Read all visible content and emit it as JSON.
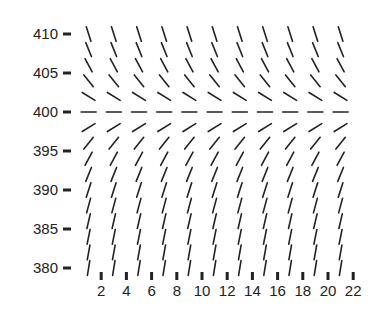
{
  "chart_data": {
    "type": "slope-field",
    "title": "",
    "xlabel": "",
    "ylabel": "",
    "xlim": [
      0,
      22
    ],
    "ylim": [
      380,
      410
    ],
    "x_ticks": [
      2,
      4,
      6,
      8,
      10,
      12,
      14,
      16,
      18,
      20,
      22
    ],
    "y_ticks": [
      380,
      385,
      390,
      395,
      400,
      405,
      410
    ],
    "grid": false,
    "legend": null,
    "field": {
      "equation": "dy/dx = k * (400 - y)",
      "k": 0.5,
      "equilibrium_y": 400,
      "x_samples": [
        1,
        3,
        5,
        7,
        9,
        11,
        13,
        15,
        17,
        19,
        21
      ],
      "y_samples": [
        380,
        382,
        384,
        386,
        388,
        390,
        392,
        394,
        396,
        398,
        400,
        402,
        404,
        406,
        408,
        410
      ]
    },
    "colors": {
      "segment": "#222222",
      "axis": "#222222",
      "background": "#ffffff"
    }
  }
}
